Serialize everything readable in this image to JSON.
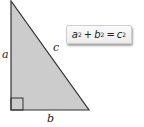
{
  "diagram": {
    "type": "right-triangle",
    "fill_color": "#cccccc",
    "stroke_color": "#333333",
    "labels": {
      "a": "a",
      "b": "b",
      "c": "c"
    },
    "formula": {
      "var1": "a",
      "exp1": "2",
      "plus": "+",
      "var2": "b",
      "exp2": "2",
      "equals": "=",
      "var3": "c",
      "exp3": "2"
    }
  }
}
